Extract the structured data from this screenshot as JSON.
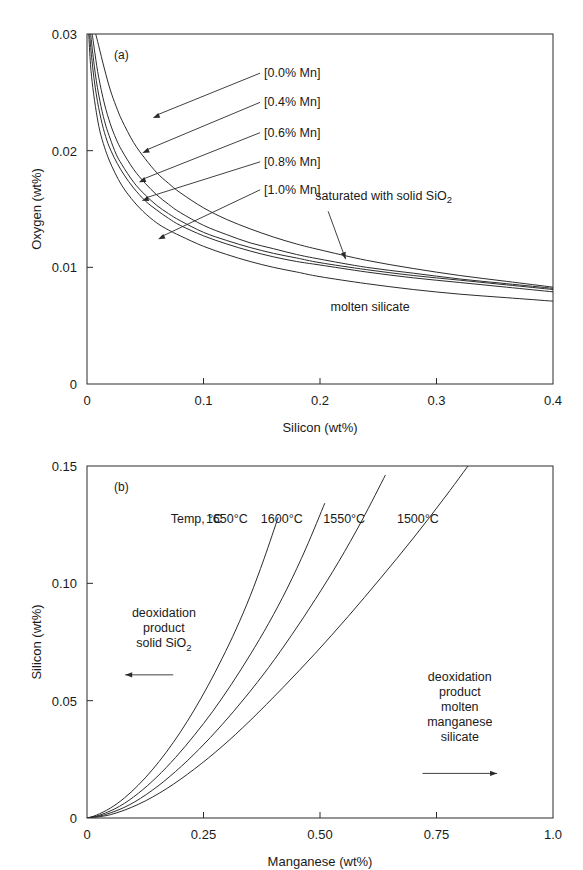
{
  "figure": {
    "background": "#ffffff",
    "line_color": "#2b2b2b",
    "text_color": "#1a1a1a"
  },
  "chart_data": [
    {
      "id": "panel-a",
      "type": "line",
      "panel_label": "(a)",
      "title": "",
      "xlabel": "Silicon (wt%)",
      "ylabel": "Oxygen (wt%)",
      "xlim": [
        0,
        0.4
      ],
      "ylim": [
        0,
        0.03
      ],
      "xticks": [
        0,
        0.1,
        0.2,
        0.3,
        0.4
      ],
      "xticklabels": [
        "0",
        "0.1",
        "0.2",
        "0.3",
        "0.4"
      ],
      "yticks": [
        0,
        0.01,
        0.02,
        0.03
      ],
      "yticklabels": [
        "0",
        "0.01",
        "0.02",
        "0.03"
      ],
      "grid": false,
      "legend_position": "inline-annotations",
      "series": [
        {
          "name": "[0.0% Mn]",
          "x": [
            0.0075,
            0.01,
            0.015,
            0.02,
            0.025,
            0.03,
            0.04,
            0.05,
            0.06,
            0.07,
            0.08,
            0.1,
            0.12,
            0.14,
            0.16,
            0.18,
            0.2,
            0.24,
            0.28,
            0.32,
            0.36,
            0.4
          ],
          "y": [
            0.03,
            0.029,
            0.027,
            0.0252,
            0.0238,
            0.0226,
            0.0207,
            0.0193,
            0.0181,
            0.0172,
            0.0164,
            0.0151,
            0.0141,
            0.0133,
            0.0126,
            0.012,
            0.0115,
            0.0106,
            0.0099,
            0.0093,
            0.0088,
            0.0083
          ]
        },
        {
          "name": "[0.4% Mn]",
          "x": [
            0.0045,
            0.007,
            0.01,
            0.015,
            0.02,
            0.025,
            0.03,
            0.04,
            0.05,
            0.06,
            0.07,
            0.08,
            0.1,
            0.12,
            0.14,
            0.16,
            0.18,
            0.2,
            0.24,
            0.28,
            0.32,
            0.36,
            0.4
          ],
          "y": [
            0.03,
            0.0282,
            0.0263,
            0.024,
            0.0223,
            0.021,
            0.02,
            0.0184,
            0.0172,
            0.0162,
            0.0154,
            0.0147,
            0.0136,
            0.0128,
            0.0121,
            0.0116,
            0.0111,
            0.0107,
            0.01,
            0.0095,
            0.009,
            0.0086,
            0.0082
          ]
        },
        {
          "name": "[0.6% Mn]",
          "x": [
            0.0032,
            0.005,
            0.008,
            0.012,
            0.016,
            0.02,
            0.025,
            0.03,
            0.04,
            0.05,
            0.06,
            0.07,
            0.08,
            0.1,
            0.12,
            0.14,
            0.16,
            0.18,
            0.2,
            0.24,
            0.28,
            0.32,
            0.36,
            0.4
          ],
          "y": [
            0.03,
            0.0283,
            0.026,
            0.0238,
            0.0222,
            0.021,
            0.0197,
            0.0188,
            0.0173,
            0.0162,
            0.0153,
            0.0146,
            0.014,
            0.013,
            0.0123,
            0.0117,
            0.0112,
            0.0108,
            0.0104,
            0.0098,
            0.0093,
            0.0089,
            0.0085,
            0.0081
          ]
        },
        {
          "name": "[0.8% Mn]",
          "x": [
            0.0022,
            0.004,
            0.006,
            0.009,
            0.013,
            0.017,
            0.021,
            0.026,
            0.032,
            0.04,
            0.05,
            0.06,
            0.07,
            0.08,
            0.1,
            0.12,
            0.14,
            0.16,
            0.18,
            0.2,
            0.24,
            0.28,
            0.32,
            0.36,
            0.4
          ],
          "y": [
            0.03,
            0.028,
            0.0262,
            0.0242,
            0.0223,
            0.0209,
            0.0199,
            0.0189,
            0.0179,
            0.0168,
            0.0157,
            0.0149,
            0.0142,
            0.0136,
            0.0127,
            0.012,
            0.0114,
            0.0109,
            0.0105,
            0.0102,
            0.0096,
            0.0091,
            0.0087,
            0.0083,
            0.0079
          ]
        },
        {
          "name": "[1.0% Mn]",
          "x": [
            0.0015,
            0.003,
            0.005,
            0.008,
            0.011,
            0.015,
            0.019,
            0.024,
            0.03,
            0.038,
            0.048,
            0.06,
            0.07,
            0.08,
            0.1,
            0.12,
            0.14,
            0.16,
            0.18,
            0.2,
            0.24,
            0.28,
            0.32,
            0.36,
            0.4
          ],
          "y": [
            0.03,
            0.0274,
            0.0254,
            0.0233,
            0.0217,
            0.0203,
            0.0192,
            0.0181,
            0.017,
            0.0159,
            0.0148,
            0.0138,
            0.0132,
            0.0127,
            0.0118,
            0.0111,
            0.0105,
            0.01,
            0.0096,
            0.0092,
            0.0086,
            0.0081,
            0.0077,
            0.0074,
            0.0071
          ]
        }
      ],
      "series_labels": [
        {
          "text": "[0.0% Mn]",
          "label_x": 0.152,
          "label_y": 0.0263,
          "arrow_x": 0.0565,
          "arrow_y": 0.0228
        },
        {
          "text": "[0.4% Mn]",
          "label_x": 0.152,
          "label_y": 0.0238,
          "arrow_x": 0.0475,
          "arrow_y": 0.0198
        },
        {
          "text": "[0.6% Mn]",
          "label_x": 0.152,
          "label_y": 0.0212,
          "arrow_x": 0.0445,
          "arrow_y": 0.0173
        },
        {
          "text": "[0.8% Mn]",
          "label_x": 0.152,
          "label_y": 0.0187,
          "arrow_x": 0.047,
          "arrow_y": 0.0157
        },
        {
          "text": "[1.0% Mn]",
          "label_x": 0.152,
          "label_y": 0.0163,
          "arrow_x": 0.061,
          "arrow_y": 0.0124
        }
      ],
      "annotations": [
        {
          "name": "saturated-with-solid-sio2",
          "text_main": "saturated with solid SiO",
          "text_sub": "2",
          "text_x": 0.196,
          "text_y": 0.0158,
          "arrow_from_x": 0.207,
          "arrow_from_y": 0.0148,
          "arrow_to_x": 0.222,
          "arrow_to_y": 0.0107
        },
        {
          "name": "molten-silicate",
          "text_main": "molten silicate",
          "text_sub": "",
          "text_x": 0.209,
          "text_y": 0.0063,
          "arrow_from_x": null,
          "arrow_from_y": null,
          "arrow_to_x": null,
          "arrow_to_y": null
        }
      ]
    },
    {
      "id": "panel-b",
      "type": "line",
      "panel_label": "(b)",
      "title": "",
      "xlabel": "Manganese (wt%)",
      "ylabel": "Silicon (wt%)",
      "xlim": [
        0,
        1.0
      ],
      "ylim": [
        0,
        0.15
      ],
      "xticks": [
        0,
        0.25,
        0.5,
        0.75,
        1.0
      ],
      "xticklabels": [
        "0",
        "0.25",
        "0.50",
        "0.75",
        "1.0"
      ],
      "yticks": [
        0,
        0.05,
        0.1,
        0.15
      ],
      "yticklabels": [
        "0",
        "0.05",
        "0.10",
        "0.15"
      ],
      "grid": false,
      "legend_position": "inline-curve-labels",
      "temp_header": "Temp, °C",
      "temp_header_x": 0.235,
      "temp_header_y": 0.1255,
      "series": [
        {
          "name": "1650°C",
          "label_x": 0.3,
          "label_y": 0.1255,
          "x": [
            0,
            0.02,
            0.05,
            0.08,
            0.11,
            0.14,
            0.17,
            0.2,
            0.23,
            0.26,
            0.29,
            0.32,
            0.35,
            0.38,
            0.41
          ],
          "y": [
            0,
            0.0012,
            0.0042,
            0.0085,
            0.014,
            0.0205,
            0.028,
            0.0365,
            0.046,
            0.0565,
            0.068,
            0.0805,
            0.0945,
            0.1105,
            0.128
          ]
        },
        {
          "name": "1600°C",
          "label_x": 0.418,
          "label_y": 0.1255,
          "x": [
            0,
            0.03,
            0.07,
            0.11,
            0.15,
            0.19,
            0.23,
            0.27,
            0.31,
            0.35,
            0.39,
            0.43,
            0.47,
            0.51
          ],
          "y": [
            0,
            0.0014,
            0.005,
            0.0105,
            0.0175,
            0.0258,
            0.0352,
            0.0455,
            0.057,
            0.0695,
            0.083,
            0.098,
            0.115,
            0.134
          ]
        },
        {
          "name": "1550°C",
          "label_x": 0.552,
          "label_y": 0.1255,
          "x": [
            0,
            0.04,
            0.09,
            0.14,
            0.19,
            0.24,
            0.29,
            0.34,
            0.39,
            0.44,
            0.49,
            0.54,
            0.59,
            0.64
          ],
          "y": [
            0,
            0.0015,
            0.0055,
            0.0118,
            0.0198,
            0.0292,
            0.0398,
            0.0515,
            0.0642,
            0.0782,
            0.0932,
            0.1092,
            0.1268,
            0.146
          ]
        },
        {
          "name": "1500°C",
          "label_x": 0.71,
          "label_y": 0.1255,
          "x": [
            0,
            0.05,
            0.11,
            0.17,
            0.23,
            0.29,
            0.35,
            0.42,
            0.49,
            0.56,
            0.63,
            0.7,
            0.77,
            0.84,
            0.88
          ],
          "y": [
            0,
            0.0014,
            0.0058,
            0.0124,
            0.0208,
            0.0305,
            0.0415,
            0.0555,
            0.0702,
            0.0858,
            0.1022,
            0.1192,
            0.1372,
            0.156,
            0.166
          ]
        }
      ],
      "annotations": [
        {
          "name": "deoxidation-product-solid-sio2",
          "lines": [
            "deoxidation",
            "product",
            "solid SiO"
          ],
          "subscript": "2",
          "text_x": 0.165,
          "text_y": 0.0855,
          "arrow_x1": 0.185,
          "arrow_x2": 0.082,
          "arrow_y": 0.061,
          "arrow_direction": "left"
        },
        {
          "name": "deoxidation-product-molten-manganese-silicate",
          "lines": [
            "deoxidation",
            "product",
            "molten",
            "manganese",
            "silicate"
          ],
          "subscript": "",
          "text_x": 0.8,
          "text_y": 0.0585,
          "arrow_x1": 0.72,
          "arrow_x2": 0.88,
          "arrow_y": 0.019,
          "arrow_direction": "right"
        }
      ]
    }
  ]
}
